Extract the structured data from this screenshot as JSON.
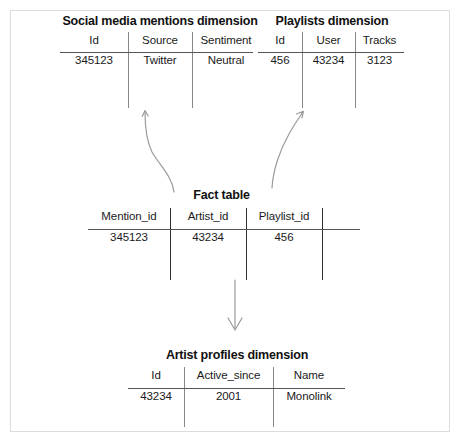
{
  "diagram": {
    "type": "star-schema",
    "tables": [
      {
        "id": "social-media-mentions-dimension",
        "title": "Social media mentions dimension",
        "columns": [
          "Id",
          "Source",
          "Sentiment"
        ],
        "rows": [
          [
            "345123",
            "Twitter",
            "Neutral"
          ]
        ]
      },
      {
        "id": "playlists-dimension",
        "title": "Playlists dimension",
        "columns": [
          "Id",
          "User",
          "Tracks"
        ],
        "rows": [
          [
            "456",
            "43234",
            "3123"
          ]
        ]
      },
      {
        "id": "fact-table",
        "title": "Fact table",
        "columns": [
          "Mention_id",
          "Artist_id",
          "Playlist_id",
          ""
        ],
        "rows": [
          [
            "345123",
            "43234",
            "456",
            ""
          ]
        ]
      },
      {
        "id": "artist-profiles-dimension",
        "title": "Artist profiles dimension",
        "columns": [
          "Id",
          "Active_since",
          "Name"
        ],
        "rows": [
          [
            "43234",
            "2001",
            "Monolink"
          ]
        ]
      }
    ],
    "connectors": [
      {
        "id": "fact-to-social-media-mentions",
        "from": "fact-table",
        "to": "social-media-mentions-dimension",
        "style": "curved",
        "direction": "up-left"
      },
      {
        "id": "fact-to-playlists",
        "from": "fact-table",
        "to": "playlists-dimension",
        "style": "curved",
        "direction": "up-right"
      },
      {
        "id": "fact-to-artist-profiles",
        "from": "fact-table",
        "to": "artist-profiles-dimension",
        "style": "straight",
        "direction": "down"
      }
    ]
  },
  "colors": {
    "text": "#1a1a1a",
    "rule": "#555555",
    "separator": "#888888",
    "frame": "#dcdcdc",
    "arrow": "#9a9a9a",
    "background": "#ffffff"
  }
}
